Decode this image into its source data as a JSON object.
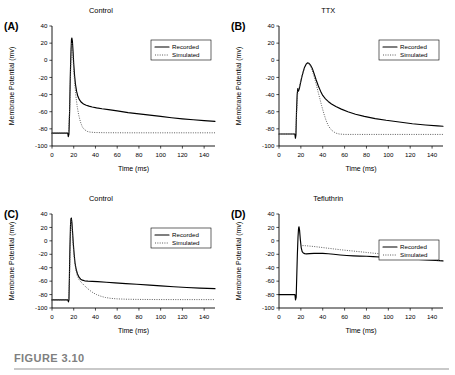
{
  "figure": {
    "caption_label": "FIGURE 3.10"
  },
  "axes": {
    "xlabel": "Time (ms)",
    "ylabel": "Membrane Potential (mv)",
    "xlim": [
      0,
      150
    ],
    "ylim": [
      -100,
      40
    ],
    "xticks": [
      0,
      20,
      40,
      60,
      80,
      100,
      120,
      140
    ],
    "xtick_labels": [
      "0",
      "20",
      "40",
      "60",
      "80",
      "100",
      "120",
      "140"
    ],
    "yticks": [
      40,
      20,
      0,
      -20,
      -40,
      -60,
      -80,
      -100
    ],
    "ytick_labels": [
      "40",
      "20",
      "0",
      "-20",
      "-40",
      "-60",
      "-80",
      "-100"
    ],
    "grid": false
  },
  "legend": {
    "position": "upper-right",
    "entries": [
      {
        "label": "Recorded",
        "style": "solid"
      },
      {
        "label": "Simulated",
        "style": "dotted"
      }
    ]
  },
  "chart_data": [
    {
      "type": "line",
      "panel": "A",
      "panel_letter": "(A)",
      "title": "Control",
      "xlabel": "Time (ms)",
      "ylabel": "Membrane Potential (mv)",
      "xlim": [
        0,
        150
      ],
      "ylim": [
        -100,
        40
      ],
      "series": [
        {
          "name": "Recorded",
          "style": "solid",
          "points": [
            [
              0,
              -85
            ],
            [
              13.5,
              -85
            ],
            [
              14.5,
              -85
            ],
            [
              15,
              -89
            ],
            [
              15.6,
              -86
            ],
            [
              16.2,
              -60
            ],
            [
              16.8,
              -20
            ],
            [
              17.4,
              8
            ],
            [
              17.9,
              24
            ],
            [
              18.3,
              26
            ],
            [
              18.8,
              22
            ],
            [
              19.4,
              10
            ],
            [
              20,
              -4
            ],
            [
              20.8,
              -18
            ],
            [
              21.6,
              -28
            ],
            [
              22.6,
              -36
            ],
            [
              23.8,
              -42
            ],
            [
              25.2,
              -46
            ],
            [
              27,
              -49
            ],
            [
              29,
              -51
            ],
            [
              31.5,
              -52.5
            ],
            [
              34,
              -53.5
            ],
            [
              37,
              -54.5
            ],
            [
              41,
              -55.5
            ],
            [
              46,
              -56.5
            ],
            [
              52,
              -57.5
            ],
            [
              60,
              -59
            ],
            [
              70,
              -61
            ],
            [
              80,
              -62.5
            ],
            [
              90,
              -64
            ],
            [
              100,
              -65.5
            ],
            [
              110,
              -67
            ],
            [
              120,
              -68.3
            ],
            [
              130,
              -69.4
            ],
            [
              140,
              -70.4
            ],
            [
              150,
              -71.2
            ]
          ]
        },
        {
          "name": "Simulated",
          "style": "dotted",
          "points": [
            [
              0,
              -85
            ],
            [
              13.5,
              -85
            ],
            [
              15.2,
              -85
            ],
            [
              16.3,
              -55
            ],
            [
              17.2,
              -10
            ],
            [
              17.8,
              14
            ],
            [
              18.2,
              21
            ],
            [
              18.7,
              16
            ],
            [
              19.3,
              4
            ],
            [
              20,
              -12
            ],
            [
              21,
              -28
            ],
            [
              22,
              -42
            ],
            [
              23.2,
              -54
            ],
            [
              24.6,
              -64
            ],
            [
              26.2,
              -72
            ],
            [
              28,
              -78
            ],
            [
              30,
              -81
            ],
            [
              32.5,
              -83
            ],
            [
              35,
              -83.8
            ],
            [
              40,
              -84.3
            ],
            [
              50,
              -84.5
            ],
            [
              70,
              -84.6
            ],
            [
              100,
              -84.6
            ],
            [
              130,
              -84.6
            ],
            [
              150,
              -84.6
            ]
          ]
        }
      ]
    },
    {
      "type": "line",
      "panel": "B",
      "panel_letter": "(B)",
      "title": "TTX",
      "xlabel": "Time (ms)",
      "ylabel": "Membrane Potential (mv)",
      "xlim": [
        0,
        150
      ],
      "ylim": [
        -100,
        40
      ],
      "series": [
        {
          "name": "Recorded",
          "style": "solid",
          "points": [
            [
              0,
              -86
            ],
            [
              13.5,
              -86
            ],
            [
              14.5,
              -86
            ],
            [
              15,
              -91
            ],
            [
              15.5,
              -87
            ],
            [
              16,
              -60
            ],
            [
              16.6,
              -40
            ],
            [
              17.2,
              -33
            ],
            [
              17.8,
              -36
            ],
            [
              18.6,
              -33
            ],
            [
              19.6,
              -27
            ],
            [
              20.8,
              -20
            ],
            [
              22,
              -14
            ],
            [
              23.4,
              -8
            ],
            [
              24.8,
              -4.5
            ],
            [
              26,
              -3
            ],
            [
              27.4,
              -3.5
            ],
            [
              29,
              -6
            ],
            [
              30.6,
              -10
            ],
            [
              32.2,
              -16
            ],
            [
              34,
              -23
            ],
            [
              36,
              -30
            ],
            [
              38,
              -36
            ],
            [
              40,
              -41
            ],
            [
              42.5,
              -45
            ],
            [
              45,
              -48
            ],
            [
              48,
              -51
            ],
            [
              52,
              -54
            ],
            [
              57,
              -57
            ],
            [
              63,
              -60
            ],
            [
              70,
              -63
            ],
            [
              78,
              -65.5
            ],
            [
              88,
              -68
            ],
            [
              98,
              -70
            ],
            [
              110,
              -72
            ],
            [
              122,
              -74
            ],
            [
              134,
              -75.5
            ],
            [
              145,
              -76.6
            ],
            [
              150,
              -77
            ]
          ]
        },
        {
          "name": "Simulated",
          "style": "dotted",
          "points": [
            [
              0,
              -86
            ],
            [
              13.5,
              -86
            ],
            [
              15.2,
              -86
            ],
            [
              16.2,
              -60
            ],
            [
              17,
              -40
            ],
            [
              17.8,
              -34
            ],
            [
              18.8,
              -30
            ],
            [
              20.2,
              -22
            ],
            [
              21.8,
              -15
            ],
            [
              23.4,
              -9
            ],
            [
              25,
              -5
            ],
            [
              26.4,
              -3.5
            ],
            [
              28,
              -5
            ],
            [
              29.6,
              -9
            ],
            [
              31.4,
              -16
            ],
            [
              33.2,
              -24
            ],
            [
              35,
              -33
            ],
            [
              37,
              -43
            ],
            [
              39,
              -53
            ],
            [
              41,
              -62
            ],
            [
              43,
              -70
            ],
            [
              45,
              -76
            ],
            [
              47,
              -80
            ],
            [
              49.5,
              -83
            ],
            [
              52,
              -85
            ],
            [
              55,
              -86
            ],
            [
              60,
              -86.5
            ],
            [
              70,
              -86.5
            ],
            [
              90,
              -86.5
            ],
            [
              120,
              -86.5
            ],
            [
              150,
              -86.5
            ]
          ]
        }
      ]
    },
    {
      "type": "line",
      "panel": "C",
      "panel_letter": "(C)",
      "title": "Control",
      "xlabel": "Time (ms)",
      "ylabel": "Membrane Potential (mv)",
      "xlim": [
        0,
        150
      ],
      "ylim": [
        -100,
        40
      ],
      "series": [
        {
          "name": "Recorded",
          "style": "solid",
          "points": [
            [
              0,
              -88
            ],
            [
              13.5,
              -88
            ],
            [
              14.6,
              -88
            ],
            [
              15.1,
              -91
            ],
            [
              15.6,
              -88
            ],
            [
              16,
              -55
            ],
            [
              16.5,
              -10
            ],
            [
              17,
              22
            ],
            [
              17.4,
              33
            ],
            [
              17.8,
              34
            ],
            [
              18.3,
              28
            ],
            [
              18.9,
              14
            ],
            [
              19.6,
              -4
            ],
            [
              20.4,
              -20
            ],
            [
              21.2,
              -33
            ],
            [
              22.2,
              -42
            ],
            [
              23.4,
              -49
            ],
            [
              24.8,
              -54
            ],
            [
              26.4,
              -57
            ],
            [
              28,
              -58.5
            ],
            [
              30,
              -59.5
            ],
            [
              33,
              -60
            ],
            [
              37,
              -60.3
            ],
            [
              42,
              -60.8
            ],
            [
              50,
              -61.6
            ],
            [
              58,
              -62.5
            ],
            [
              68,
              -63.6
            ],
            [
              78,
              -64.7
            ],
            [
              90,
              -66
            ],
            [
              100,
              -67
            ],
            [
              112,
              -68.3
            ],
            [
              124,
              -69.4
            ],
            [
              136,
              -70.3
            ],
            [
              150,
              -71.2
            ]
          ]
        },
        {
          "name": "Simulated",
          "style": "dotted",
          "points": [
            [
              0,
              -88
            ],
            [
              13.5,
              -88
            ],
            [
              15.3,
              -88
            ],
            [
              16.1,
              -55
            ],
            [
              16.7,
              -8
            ],
            [
              17.2,
              24
            ],
            [
              17.6,
              32
            ],
            [
              18.1,
              26
            ],
            [
              18.8,
              10
            ],
            [
              19.6,
              -10
            ],
            [
              20.6,
              -28
            ],
            [
              21.8,
              -42
            ],
            [
              23.2,
              -52
            ],
            [
              25,
              -58
            ],
            [
              27,
              -62
            ],
            [
              29.5,
              -66
            ],
            [
              32,
              -70
            ],
            [
              35,
              -74
            ],
            [
              38,
              -77.5
            ],
            [
              41,
              -80
            ],
            [
              45,
              -82.5
            ],
            [
              49,
              -84.3
            ],
            [
              54,
              -85.6
            ],
            [
              60,
              -86.4
            ],
            [
              68,
              -86.9
            ],
            [
              78,
              -87.2
            ],
            [
              95,
              -87.4
            ],
            [
              120,
              -87.5
            ],
            [
              150,
              -87.5
            ]
          ]
        }
      ]
    },
    {
      "type": "line",
      "panel": "D",
      "panel_letter": "(D)",
      "title": "Tefluthrin",
      "xlabel": "Time (ms)",
      "ylabel": "Membrane Potential (mv)",
      "xlim": [
        0,
        150
      ],
      "ylim": [
        -100,
        40
      ],
      "series": [
        {
          "name": "Recorded",
          "style": "solid",
          "points": [
            [
              0,
              -80
            ],
            [
              13.5,
              -80
            ],
            [
              14.6,
              -80
            ],
            [
              15.1,
              -88
            ],
            [
              15.7,
              -84
            ],
            [
              16.2,
              -55
            ],
            [
              16.8,
              -20
            ],
            [
              17.4,
              6
            ],
            [
              17.9,
              19
            ],
            [
              18.3,
              21
            ],
            [
              18.8,
              16
            ],
            [
              19.5,
              2
            ],
            [
              20.3,
              -10
            ],
            [
              21.2,
              -16
            ],
            [
              22.2,
              -18
            ],
            [
              23.5,
              -19
            ],
            [
              25,
              -19.3
            ],
            [
              28,
              -19
            ],
            [
              32,
              -18.6
            ],
            [
              36,
              -18.5
            ],
            [
              40,
              -18.6
            ],
            [
              45,
              -19.2
            ],
            [
              50,
              -20
            ],
            [
              56,
              -21
            ],
            [
              62,
              -21.8
            ],
            [
              68,
              -22.4
            ],
            [
              74,
              -22.8
            ],
            [
              80,
              -23
            ],
            [
              86,
              -23.4
            ],
            [
              92,
              -24
            ],
            [
              100,
              -24.8
            ],
            [
              108,
              -25.6
            ],
            [
              116,
              -26.4
            ],
            [
              124,
              -27.2
            ],
            [
              132,
              -28
            ],
            [
              140,
              -28.8
            ],
            [
              150,
              -29.8
            ]
          ]
        },
        {
          "name": "Simulated",
          "style": "dotted",
          "points": [
            [
              21.5,
              -7
            ],
            [
              24,
              -7.2
            ],
            [
              28,
              -7.8
            ],
            [
              33,
              -8.6
            ],
            [
              38,
              -9.6
            ],
            [
              44,
              -10.8
            ],
            [
              50,
              -12
            ],
            [
              56,
              -13.2
            ],
            [
              62,
              -14.2
            ],
            [
              68,
              -15.2
            ],
            [
              75,
              -16.4
            ],
            [
              82,
              -17.6
            ],
            [
              90,
              -18.9
            ],
            [
              98,
              -20.2
            ],
            [
              106,
              -21.5
            ],
            [
              114,
              -22.8
            ],
            [
              122,
              -24.2
            ],
            [
              130,
              -25.8
            ],
            [
              138,
              -27.4
            ],
            [
              145,
              -28.8
            ],
            [
              150,
              -29.8
            ]
          ]
        }
      ]
    }
  ]
}
